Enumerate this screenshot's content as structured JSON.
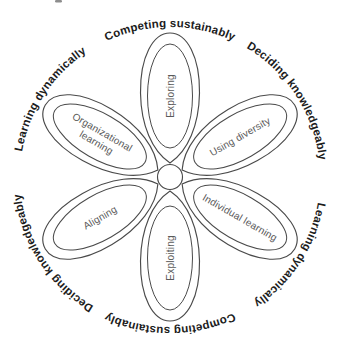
{
  "diagram": {
    "petals": [
      {
        "label": "Exploring",
        "position": "top"
      },
      {
        "label": "Using diversity",
        "position": "upper-right"
      },
      {
        "label": "Individual learning",
        "position": "lower-right"
      },
      {
        "label": "Exploiting",
        "position": "bottom"
      },
      {
        "label": "Aligning",
        "position": "lower-left"
      },
      {
        "label": "Organizational learning",
        "line1": "Organizational",
        "line2": "learning",
        "position": "upper-left"
      }
    ],
    "ring_labels": [
      {
        "text": "Competing sustainably",
        "positions": [
          "top",
          "bottom-inverted"
        ]
      },
      {
        "text": "Deciding knowledgeably",
        "positions": [
          "upper-right",
          "lower-left-inverted"
        ]
      },
      {
        "text": "Learning dynamically",
        "positions": [
          "upper-left",
          "lower-right-inverted"
        ]
      }
    ],
    "colors": {
      "stroke": "#4a4a4a",
      "petal_text": "#5a5a5a",
      "ring_text": "#1c1c1c",
      "background": "#ffffff"
    }
  }
}
